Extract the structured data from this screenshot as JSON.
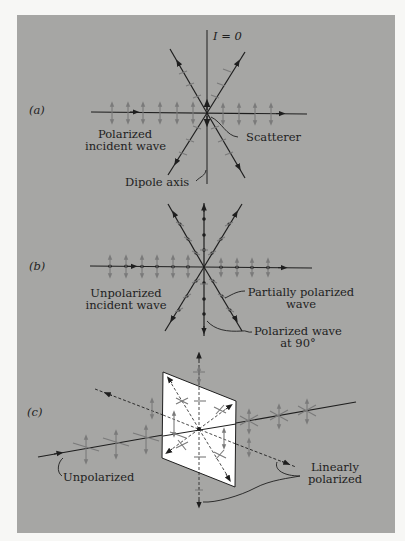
{
  "figure": {
    "panel_a": {
      "label": "(a)",
      "intensity_label": "I = 0",
      "incident_label_line1": "Polarized",
      "incident_label_line2": "incident wave",
      "scatterer_label": "Scatterer",
      "dipole_label": "Dipole axis"
    },
    "panel_b": {
      "label": "(b)",
      "incident_label_line1": "Unpolarized",
      "incident_label_line2": "incident wave",
      "partial_label_line1": "Partially polarized",
      "partial_label_line2": "wave",
      "polarized_label_line1": "Polarized wave",
      "polarized_label_line2": "at 90°"
    },
    "panel_c": {
      "label": "(c)",
      "unpolarized_label": "Unpolarized",
      "linear_label_line1": "Linearly",
      "linear_label_line2": "polarized"
    }
  },
  "colors": {
    "background": "#a6a6a4",
    "ink": "#1e1e1e",
    "field_arrows": "#7a7a7a",
    "screen": "#ffffff"
  }
}
